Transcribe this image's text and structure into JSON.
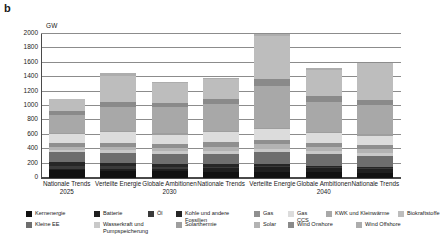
{
  "panel": {
    "letter": "b"
  },
  "chart_data": {
    "type": "bar",
    "stacked": true,
    "title": "",
    "xlabel": "",
    "ylabel": "GW",
    "unit": "GW",
    "ylim": [
      0,
      2000
    ],
    "yticks": [
      0,
      200,
      400,
      600,
      800,
      1000,
      1200,
      1400,
      1600,
      1800,
      2000
    ],
    "grid": true,
    "legend_position": "bottom",
    "categories": [
      {
        "name": "Nationale Trends",
        "year": "2025"
      },
      {
        "name": "Verteilte Energie",
        "year": ""
      },
      {
        "name": "Globale Ambitionen",
        "year": "2030"
      },
      {
        "name": "Nationale Trends",
        "year": ""
      },
      {
        "name": "Verteilte Energie",
        "year": ""
      },
      {
        "name": "Globale Ambitionen",
        "year": "2040"
      },
      {
        "name": "Nationale Trends",
        "year": ""
      }
    ],
    "series": [
      {
        "name": "Kernenergie",
        "color": "#111111",
        "values": [
          110,
          100,
          95,
          90,
          85,
          80,
          75
        ]
      },
      {
        "name": "Batterie",
        "color": "#1f1f1f",
        "values": [
          20,
          30,
          35,
          45,
          65,
          55,
          50
        ]
      },
      {
        "name": "Öl",
        "color": "#3a3a3a",
        "values": [
          40,
          35,
          30,
          25,
          20,
          18,
          15
        ]
      },
      {
        "name": "Kohle und andere Fossilien",
        "color": "#262626",
        "values": [
          55,
          45,
          40,
          30,
          25,
          20,
          18
        ]
      },
      {
        "name": "Kleine EE",
        "color": "#6e6e6e",
        "values": [
          130,
          140,
          135,
          150,
          170,
          160,
          155
        ]
      },
      {
        "name": "Wasserkraft und Pumpspeicherung",
        "color": "#c9c9c9",
        "values": [
          35,
          38,
          38,
          40,
          42,
          40,
          40
        ]
      },
      {
        "name": "Solar",
        "color": "#b3b3b3",
        "values": [
          40,
          45,
          45,
          55,
          60,
          55,
          52
        ]
      },
      {
        "name": "Gas",
        "color": "#8f8f8f",
        "values": [
          55,
          60,
          55,
          60,
          58,
          55,
          50
        ]
      },
      {
        "name": "Gas CCS",
        "color": "#dcdcdc",
        "values": [
          130,
          140,
          130,
          140,
          150,
          140,
          135
        ]
      },
      {
        "name": "Solarthermie",
        "color": "#9e9e9e",
        "values": [
          15,
          18,
          18,
          20,
          22,
          20,
          20
        ]
      },
      {
        "name": "KWK und Kleinwärme",
        "color": "#a8a8a8",
        "values": [
          250,
          330,
          360,
          380,
          580,
          420,
          400
        ]
      },
      {
        "name": "Wind Onshore",
        "color": "#8a8a8a",
        "values": [
          55,
          70,
          60,
          65,
          100,
          80,
          75
        ]
      },
      {
        "name": "Biokraftstoffe",
        "color": "#bdbdbd",
        "values": [
          165,
          370,
          280,
          275,
          600,
          360,
          510
        ]
      },
      {
        "name": "Wind Offshore",
        "color": "#adadad",
        "values": [
          0,
          40,
          10,
          10,
          25,
          25,
          10
        ]
      }
    ],
    "totals": [
      1100,
      1461,
      1331,
      1385,
      2002,
      1528,
      1605
    ]
  },
  "legend": {
    "row1": [
      {
        "label": "Kernenergie",
        "color": "#111111"
      },
      {
        "label": "Batterie",
        "color": "#1f1f1f"
      },
      {
        "label": "Öl",
        "color": "#3a3a3a"
      },
      {
        "label": "Kohle und andere Fossilien",
        "color": "#262626"
      },
      {
        "label": "Gas",
        "color": "#8f8f8f"
      },
      {
        "label": "Gas CCS",
        "color": "#dcdcdc"
      },
      {
        "label": "KWK und Kleinwärme",
        "color": "#a8a8a8"
      },
      {
        "label": "Biokraftstoffe",
        "color": "#bdbdbd"
      }
    ],
    "row2": [
      {
        "label": "Kleine EE",
        "color": "#6e6e6e"
      },
      {
        "label": "Wasserkraft und Pumpspeicherung",
        "color": "#c9c9c9"
      },
      {
        "label": "Solar",
        "color": "#b3b3b3"
      },
      {
        "label": "Solarthermie",
        "color": "#9e9e9e"
      },
      {
        "label": "Wind Onshore",
        "color": "#8a8a8a"
      },
      {
        "label": "Wind Offshore",
        "color": "#adadad"
      }
    ]
  }
}
